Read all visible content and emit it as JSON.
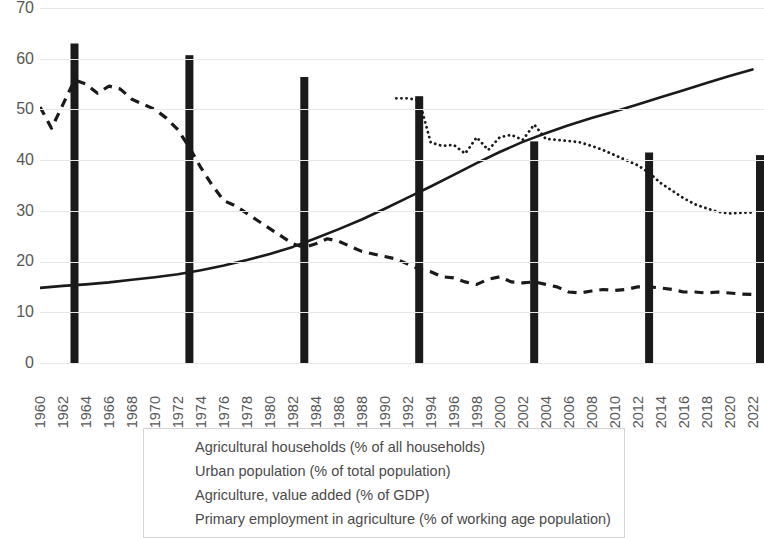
{
  "chart_data": {
    "type": "line",
    "title": "",
    "xlabel": "",
    "ylabel": "",
    "ylim": [
      0,
      70
    ],
    "y_ticks": [
      0,
      10,
      20,
      30,
      40,
      50,
      60,
      70
    ],
    "grid": true,
    "legend_position": "bottom",
    "x_tick_labels": [
      "1960",
      "1962",
      "1964",
      "1966",
      "1968",
      "1970",
      "1972",
      "1974",
      "1976",
      "1978",
      "1980",
      "1982",
      "1984",
      "1986",
      "1988",
      "1990",
      "1992",
      "1994",
      "1996",
      "1998",
      "2000",
      "2002",
      "2004",
      "2006",
      "2008",
      "2010",
      "2012",
      "2014",
      "2016",
      "2018",
      "2020",
      "2022"
    ],
    "x_range": [
      1960,
      2023
    ],
    "series": [
      {
        "name": "Agricultural households (% of all households)",
        "type": "bar",
        "style": "solid-black-bar",
        "x": [
          1963,
          1973,
          1983,
          1993,
          2003,
          2013,
          2023
        ],
        "values": [
          63,
          60.7,
          56.4,
          52.6,
          43.7,
          41.5,
          41
        ]
      },
      {
        "name": "Urban population (% of total population)",
        "type": "line",
        "style": "solid",
        "x": [
          1960,
          1962,
          1964,
          1966,
          1968,
          1970,
          1972,
          1974,
          1976,
          1978,
          1980,
          1982,
          1984,
          1986,
          1988,
          1990,
          1992,
          1994,
          1996,
          1998,
          2000,
          2002,
          2004,
          2006,
          2008,
          2010,
          2012,
          2014,
          2016,
          2018,
          2020,
          2022
        ],
        "values": [
          14.8,
          15.2,
          15.5,
          15.9,
          16.4,
          16.9,
          17.5,
          18.3,
          19.2,
          20.3,
          21.5,
          22.9,
          24.6,
          26.4,
          28.3,
          30.4,
          32.6,
          34.8,
          37.1,
          39.4,
          41.6,
          43.6,
          45.3,
          46.9,
          48.3,
          49.6,
          51.0,
          52.4,
          53.8,
          55.2,
          56.6,
          57.9
        ]
      },
      {
        "name": "Agriculture, value added (% of GDP)",
        "type": "line",
        "style": "dashed",
        "x": [
          1960,
          1961,
          1962,
          1963,
          1964,
          1965,
          1966,
          1967,
          1968,
          1969,
          1970,
          1971,
          1972,
          1973,
          1974,
          1975,
          1976,
          1977,
          1978,
          1979,
          1980,
          1981,
          1982,
          1983,
          1984,
          1985,
          1986,
          1987,
          1988,
          1989,
          1990,
          1991,
          1992,
          1993,
          1994,
          1995,
          1996,
          1997,
          1998,
          1999,
          2000,
          2001,
          2002,
          2003,
          2004,
          2005,
          2006,
          2007,
          2008,
          2009,
          2010,
          2011,
          2012,
          2013,
          2014,
          2015,
          2016,
          2017,
          2018,
          2019,
          2020,
          2021,
          2022
        ],
        "values": [
          50.5,
          46.3,
          51.0,
          55.8,
          55.0,
          53.2,
          54.6,
          54.0,
          52.0,
          51.0,
          50.0,
          48.3,
          46.0,
          42.5,
          38.5,
          35.0,
          32.0,
          31.0,
          29.5,
          28.0,
          26.5,
          25.0,
          23.5,
          22.8,
          23.5,
          24.5,
          24.0,
          23.0,
          22.0,
          21.5,
          21.0,
          20.5,
          19.5,
          18.5,
          18.0,
          17.0,
          16.8,
          16.0,
          15.5,
          16.5,
          17.0,
          16.0,
          15.8,
          16.0,
          15.5,
          15.0,
          14.0,
          13.8,
          14.2,
          14.5,
          14.3,
          14.5,
          15.0,
          15.0,
          14.8,
          14.5,
          14.0,
          14.0,
          13.8,
          14.0,
          13.8,
          13.6,
          13.5
        ]
      },
      {
        "name": "Primary employment in agriculture  (% of working age population)",
        "type": "line",
        "style": "dotted",
        "x": [
          1991,
          1992,
          1993,
          1994,
          1995,
          1996,
          1997,
          1998,
          1999,
          2000,
          2001,
          2002,
          2003,
          2004,
          2005,
          2006,
          2007,
          2008,
          2009,
          2010,
          2011,
          2012,
          2013,
          2014,
          2015,
          2016,
          2017,
          2018,
          2019,
          2020,
          2021,
          2022
        ],
        "values": [
          52.2,
          52.2,
          51.8,
          43.5,
          42.8,
          43.0,
          41.3,
          44.5,
          42.0,
          44.5,
          45.0,
          44.0,
          47.0,
          44.2,
          44.0,
          43.8,
          43.5,
          42.8,
          42.0,
          41.0,
          40.0,
          39.0,
          37.5,
          35.5,
          34.0,
          32.5,
          31.3,
          30.5,
          29.8,
          29.5,
          29.6,
          29.7
        ]
      }
    ]
  },
  "y_axis": {
    "labels": [
      "70",
      "60",
      "50",
      "40",
      "30",
      "20",
      "10",
      "0"
    ]
  },
  "legend": {
    "items": [
      {
        "label": "Agricultural households (% of all households)",
        "marker": "bar-swatch-icon"
      },
      {
        "label": "Urban population (% of total population)",
        "marker": "solid-line-icon"
      },
      {
        "label": "Agriculture, value added (% of GDP)",
        "marker": "dashed-line-icon"
      },
      {
        "label": "Primary employment in agriculture  (% of working age population)",
        "marker": "dotted-line-icon"
      }
    ]
  },
  "colors": {
    "series": "#1a1a1a",
    "grid": "#e8e8e8",
    "text": "#575757"
  }
}
